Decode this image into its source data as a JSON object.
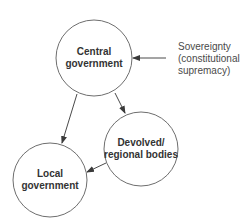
{
  "diagram": {
    "type": "flow",
    "nodes": [
      {
        "id": "central",
        "lines": [
          "Central",
          "government"
        ]
      },
      {
        "id": "devolved",
        "lines": [
          "Devolved/",
          "regional bodies"
        ]
      },
      {
        "id": "local",
        "lines": [
          "Local",
          "government"
        ]
      }
    ],
    "edges": [
      {
        "from": "central",
        "to": "local"
      },
      {
        "from": "central",
        "to": "devolved"
      },
      {
        "from": "devolved",
        "to": "local"
      },
      {
        "from": "sovereignty",
        "to": "central"
      }
    ],
    "annotation": {
      "id": "sovereignty",
      "lines": [
        "Sovereignty",
        "(constitutional",
        "supremacy)"
      ]
    },
    "colors": {
      "circle_stroke": "#6e6e6e",
      "arrow": "#4a4a4a",
      "label": "#333333"
    }
  }
}
